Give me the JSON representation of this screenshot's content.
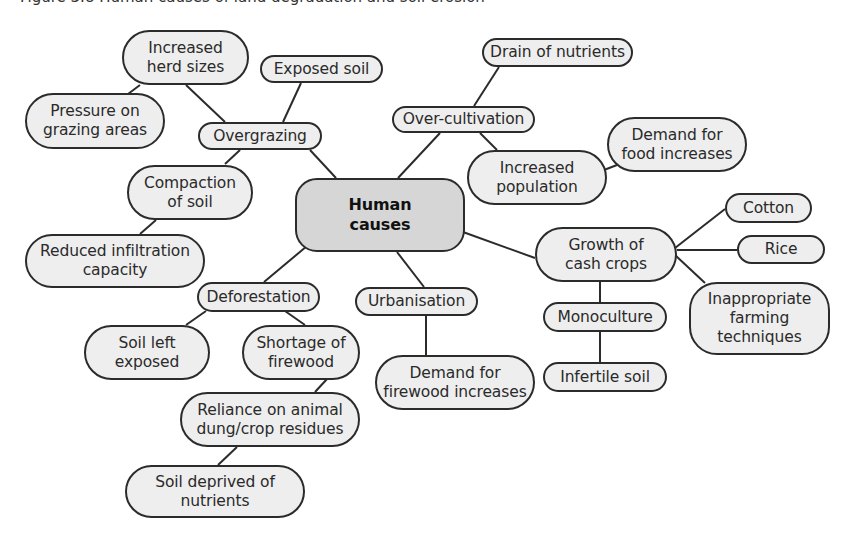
{
  "caption": "Figure 3.8 Human causes of land degradation and soil erosion",
  "central": {
    "id": "human",
    "label": "Human\ncauses"
  },
  "colors": {
    "node_fill": "#eeeeee",
    "central_fill": "#d6d6d6",
    "stroke": "#2b2b2b"
  },
  "nodes": [
    {
      "id": "human",
      "label": "Human\ncauses",
      "x": 295,
      "y": 178,
      "w": 170,
      "h": 74,
      "r": 22,
      "central": true
    },
    {
      "id": "overgrazing",
      "label": "Overgrazing",
      "x": 198,
      "y": 122,
      "w": 124,
      "h": 28
    },
    {
      "id": "herd",
      "label": "Increased\nherd sizes",
      "x": 122,
      "y": 30,
      "w": 127,
      "h": 55
    },
    {
      "id": "pressure",
      "label": "Pressure on\ngrazing areas",
      "x": 25,
      "y": 93,
      "w": 140,
      "h": 56
    },
    {
      "id": "exposed",
      "label": "Exposed soil",
      "x": 260,
      "y": 55,
      "w": 123,
      "h": 28
    },
    {
      "id": "compaction",
      "label": "Compaction\nof soil",
      "x": 127,
      "y": 165,
      "w": 126,
      "h": 55
    },
    {
      "id": "infiltration",
      "label": "Reduced infiltration\ncapacity",
      "x": 25,
      "y": 234,
      "w": 180,
      "h": 54
    },
    {
      "id": "overcult",
      "label": "Over-cultivation",
      "x": 392,
      "y": 106,
      "w": 143,
      "h": 27
    },
    {
      "id": "drain",
      "label": "Drain of nutrients",
      "x": 482,
      "y": 38,
      "w": 151,
      "h": 29
    },
    {
      "id": "population",
      "label": "Increased\npopulation",
      "x": 467,
      "y": 150,
      "w": 140,
      "h": 55
    },
    {
      "id": "foodDemand",
      "label": "Demand for\nfood increases",
      "x": 607,
      "y": 117,
      "w": 140,
      "h": 55
    },
    {
      "id": "cash",
      "label": "Growth of\ncash crops",
      "x": 535,
      "y": 227,
      "w": 142,
      "h": 55
    },
    {
      "id": "cotton",
      "label": "Cotton",
      "x": 725,
      "y": 193,
      "w": 87,
      "h": 30
    },
    {
      "id": "rice",
      "label": "Rice",
      "x": 737,
      "y": 235,
      "w": 88,
      "h": 29
    },
    {
      "id": "farming",
      "label": "Inappropriate\nfarming\ntechniques",
      "x": 689,
      "y": 282,
      "w": 141,
      "h": 73
    },
    {
      "id": "mono",
      "label": "Monoculture",
      "x": 543,
      "y": 302,
      "w": 124,
      "h": 30
    },
    {
      "id": "infertile",
      "label": "Infertile soil",
      "x": 543,
      "y": 362,
      "w": 124,
      "h": 30
    },
    {
      "id": "urban",
      "label": "Urbanisation",
      "x": 355,
      "y": 287,
      "w": 123,
      "h": 29
    },
    {
      "id": "firewoodDemand",
      "label": "Demand for\nfirewood increases",
      "x": 375,
      "y": 355,
      "w": 160,
      "h": 55
    },
    {
      "id": "defor",
      "label": "Deforestation",
      "x": 197,
      "y": 282,
      "w": 123,
      "h": 30
    },
    {
      "id": "soilLeft",
      "label": "Soil left\nexposed",
      "x": 84,
      "y": 325,
      "w": 126,
      "h": 55
    },
    {
      "id": "shortage",
      "label": "Shortage of\nfirewood",
      "x": 242,
      "y": 325,
      "w": 118,
      "h": 55
    },
    {
      "id": "reliance",
      "label": "Reliance on animal\ndung/crop residues",
      "x": 180,
      "y": 392,
      "w": 180,
      "h": 55
    },
    {
      "id": "deprived",
      "label": "Soil deprived of\nnutrients",
      "x": 125,
      "y": 465,
      "w": 180,
      "h": 53
    }
  ],
  "edges": [
    {
      "from": "human",
      "to": "overgrazing",
      "p": [
        [
          336,
          178
        ],
        [
          310,
          150
        ]
      ]
    },
    {
      "from": "overgrazing",
      "to": "herd",
      "p": [
        [
          225,
          122
        ],
        [
          186,
          85
        ]
      ]
    },
    {
      "from": "herd",
      "to": "pressure",
      "p": [
        [
          140,
          85
        ],
        [
          128,
          94
        ]
      ]
    },
    {
      "from": "overgrazing",
      "to": "exposed",
      "p": [
        [
          283,
          122
        ],
        [
          301,
          83
        ]
      ]
    },
    {
      "from": "overgrazing",
      "to": "compaction",
      "p": [
        [
          240,
          150
        ],
        [
          225,
          164
        ]
      ]
    },
    {
      "from": "compaction",
      "to": "infiltration",
      "p": [
        [
          156,
          220
        ],
        [
          140,
          234
        ]
      ]
    },
    {
      "from": "human",
      "to": "overcult",
      "p": [
        [
          398,
          178
        ],
        [
          440,
          133
        ]
      ]
    },
    {
      "from": "overcult",
      "to": "drain",
      "p": [
        [
          474,
          106
        ],
        [
          499,
          67
        ]
      ]
    },
    {
      "from": "overcult",
      "to": "population",
      "p": [
        [
          480,
          133
        ],
        [
          497,
          150
        ]
      ]
    },
    {
      "from": "population",
      "to": "foodDemand",
      "p": [
        [
          604,
          170
        ],
        [
          617,
          165
        ]
      ]
    },
    {
      "from": "human",
      "to": "cash",
      "p": [
        [
          463,
          232
        ],
        [
          535,
          258
        ]
      ]
    },
    {
      "from": "cash",
      "to": "cotton",
      "p": [
        [
          675,
          248
        ],
        [
          725,
          209
        ]
      ]
    },
    {
      "from": "cash",
      "to": "rice",
      "p": [
        [
          677,
          250
        ],
        [
          737,
          250
        ]
      ]
    },
    {
      "from": "cash",
      "to": "farming",
      "p": [
        [
          675,
          255
        ],
        [
          705,
          283
        ]
      ]
    },
    {
      "from": "cash",
      "to": "mono",
      "p": [
        [
          600,
          282
        ],
        [
          600,
          302
        ]
      ]
    },
    {
      "from": "mono",
      "to": "infertile",
      "p": [
        [
          600,
          332
        ],
        [
          600,
          362
        ]
      ]
    },
    {
      "from": "human",
      "to": "urban",
      "p": [
        [
          397,
          252
        ],
        [
          424,
          287
        ]
      ]
    },
    {
      "from": "urban",
      "to": "firewoodDemand",
      "p": [
        [
          426,
          316
        ],
        [
          426,
          355
        ]
      ]
    },
    {
      "from": "human",
      "to": "defor",
      "p": [
        [
          307,
          246
        ],
        [
          264,
          282
        ]
      ]
    },
    {
      "from": "defor",
      "to": "soilLeft",
      "p": [
        [
          206,
          311
        ],
        [
          186,
          325
        ]
      ]
    },
    {
      "from": "defor",
      "to": "shortage",
      "p": [
        [
          285,
          311
        ],
        [
          305,
          325
        ]
      ]
    },
    {
      "from": "shortage",
      "to": "reliance",
      "p": [
        [
          327,
          379
        ],
        [
          315,
          392
        ]
      ]
    },
    {
      "from": "reliance",
      "to": "deprived",
      "p": [
        [
          237,
          447
        ],
        [
          218,
          465
        ]
      ]
    }
  ]
}
